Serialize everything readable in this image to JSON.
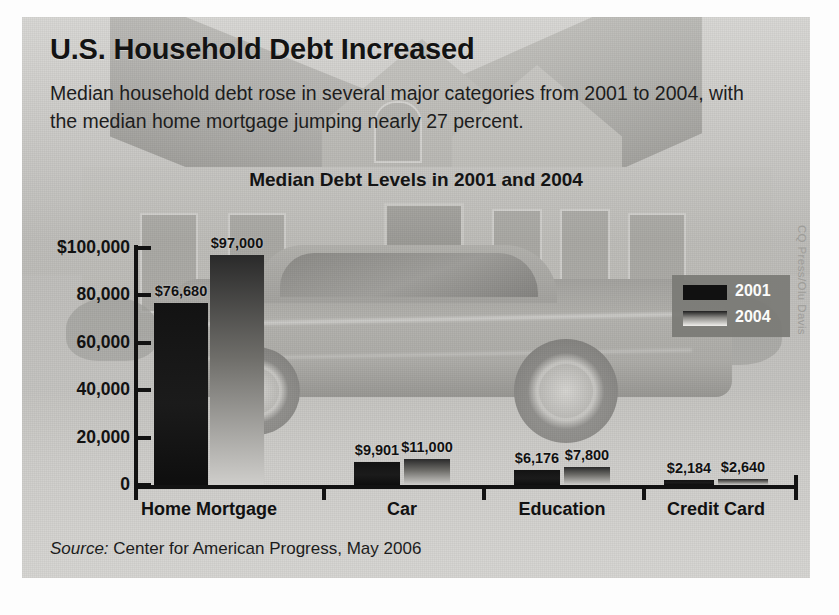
{
  "headline": "U.S. Household Debt Increased",
  "subhead": "Median household debt rose in several major categories from 2001 to 2004, with the median home mortgage jumping nearly 27 percent.",
  "source_prefix": "Source:",
  "source_text": " Center for American Progress, May 2006",
  "credit": "CQ Press/Olu Davis",
  "legend": {
    "items": [
      {
        "label": "2001"
      },
      {
        "label": "2004"
      }
    ]
  },
  "chart_data": {
    "type": "bar",
    "title": "Median Debt Levels in 2001 and 2004",
    "xlabel": "",
    "ylabel": "",
    "ylim": [
      0,
      100000
    ],
    "grid": false,
    "legend_position": "upper-right",
    "categories": [
      "Home Mortgage",
      "Car",
      "Education",
      "Credit Card"
    ],
    "ytick_labels": [
      "$100,000",
      "80,000",
      "60,000",
      "40,000",
      "20,000",
      "0"
    ],
    "ytick_values": [
      100000,
      80000,
      60000,
      40000,
      20000,
      0
    ],
    "series": [
      {
        "name": "2001",
        "color": "#131313",
        "values": [
          76680,
          9901,
          6176,
          2184
        ],
        "data_labels": [
          "$76,680",
          "$9,901",
          "$6,176",
          "$2,184"
        ]
      },
      {
        "name": "2004",
        "color": "#8e8d89",
        "values": [
          97000,
          11000,
          7800,
          2640
        ],
        "data_labels": [
          "$97,000",
          "$11,000",
          "$7,800",
          "$2,640"
        ]
      }
    ]
  }
}
